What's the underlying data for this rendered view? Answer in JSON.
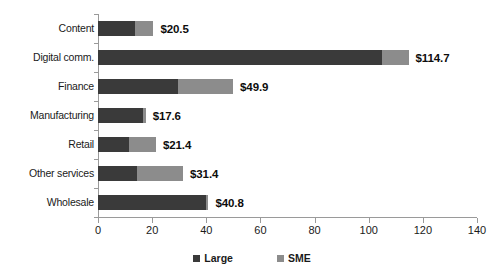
{
  "chart_data": {
    "type": "bar",
    "orientation": "horizontal",
    "stacked": true,
    "title": "",
    "subtitle": "",
    "xlabel": "",
    "ylabel": "",
    "xlim": [
      0,
      140
    ],
    "xtick_step": 20,
    "xticks": [
      "0",
      "20",
      "40",
      "60",
      "80",
      "100",
      "120",
      "140"
    ],
    "xtick_values": [
      0,
      20,
      40,
      60,
      80,
      100,
      120,
      140
    ],
    "grid": false,
    "legend_position": "bottom-center",
    "categories": [
      "Content",
      "Digital comm.",
      "Finance",
      "Manufacturing",
      "Retail",
      "Other services",
      "Wholesale"
    ],
    "series": [
      {
        "name": "Large",
        "color": "#3a3a3a",
        "values": [
          13.5,
          105.0,
          29.5,
          16.5,
          11.5,
          14.5,
          40.0
        ]
      },
      {
        "name": "SME",
        "color": "#8c8c8c",
        "values": [
          7.0,
          9.7,
          20.4,
          1.1,
          9.9,
          16.9,
          0.8
        ]
      }
    ],
    "totals": [
      20.5,
      114.7,
      49.9,
      17.6,
      21.4,
      31.4,
      40.8
    ],
    "data_labels": [
      "$20.5",
      "$114.7",
      "$49.9",
      "$17.6",
      "$21.4",
      "$31.4",
      "$40.8"
    ]
  },
  "legend": {
    "items": [
      {
        "label": "Large",
        "color": "#3a3a3a"
      },
      {
        "label": "SME",
        "color": "#8c8c8c"
      }
    ]
  },
  "axis": {
    "line_color": "#9a9a9a"
  }
}
